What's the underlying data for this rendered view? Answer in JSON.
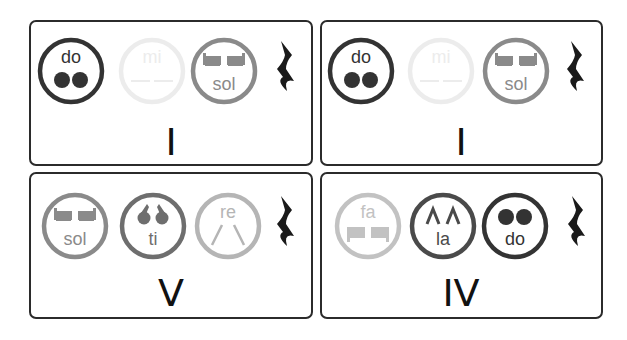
{
  "cards": [
    {
      "numeral": "I",
      "notes": [
        {
          "syllable": "do",
          "sign": "dots",
          "color": "#333333",
          "label_pos": "top"
        },
        {
          "syllable": "mi",
          "sign": "lines",
          "color": "#ececec",
          "label_pos": "top"
        },
        {
          "syllable": "sol",
          "sign": "blocks",
          "color": "#8a8a8a",
          "label_pos": "bottom"
        }
      ],
      "rest": "quarter-rest"
    },
    {
      "numeral": "I",
      "notes": [
        {
          "syllable": "do",
          "sign": "dots",
          "color": "#333333",
          "label_pos": "top"
        },
        {
          "syllable": "mi",
          "sign": "lines",
          "color": "#ececec",
          "label_pos": "top"
        },
        {
          "syllable": "sol",
          "sign": "blocks",
          "color": "#8a8a8a",
          "label_pos": "bottom"
        }
      ],
      "rest": "quarter-rest"
    },
    {
      "numeral": "V",
      "notes": [
        {
          "syllable": "sol",
          "sign": "blocks",
          "color": "#8a8a8a",
          "label_pos": "bottom"
        },
        {
          "syllable": "ti",
          "sign": "commas",
          "color": "#6e6e6e",
          "label_pos": "bottom"
        },
        {
          "syllable": "re",
          "sign": "slants",
          "color": "#b5b5b5",
          "label_pos": "top"
        }
      ],
      "rest": "quarter-rest"
    },
    {
      "numeral": "IV",
      "notes": [
        {
          "syllable": "fa",
          "sign": "blocks-down",
          "color": "#c2c2c2",
          "label_pos": "top"
        },
        {
          "syllable": "la",
          "sign": "carets",
          "color": "#4a4a4a",
          "label_pos": "bottom"
        },
        {
          "syllable": "do",
          "sign": "dots",
          "color": "#333333",
          "label_pos": "bottom"
        }
      ],
      "rest": "quarter-rest"
    }
  ]
}
